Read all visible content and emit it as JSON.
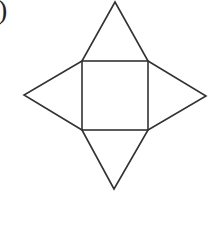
{
  "label": ")",
  "figure": {
    "stroke_color": "#333333",
    "square": {
      "x1": 82,
      "y1": 61,
      "x2": 148,
      "y2": 130
    },
    "apexes": {
      "top": [
        115,
        2
      ],
      "left": [
        24,
        95
      ],
      "right": [
        206,
        96
      ],
      "bottom": [
        114,
        189
      ]
    }
  }
}
